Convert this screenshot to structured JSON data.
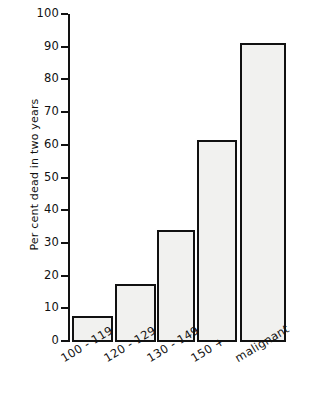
{
  "chart_data": {
    "type": "bar",
    "title": "",
    "subtitle": "",
    "xlabel": "",
    "ylabel": "Per cent dead in two years",
    "categories": [
      "100 - 119",
      "120 - 129",
      "130 - 149",
      "150 +",
      "malignant"
    ],
    "values": [
      7.5,
      17.5,
      34,
      61.5,
      91
    ],
    "ylim": [
      0,
      100
    ],
    "ytick_labels": [
      "0",
      "10",
      "20",
      "30",
      "40",
      "50",
      "60",
      "70",
      "80",
      "90",
      "100"
    ],
    "ytick_values": [
      0,
      10,
      20,
      30,
      40,
      50,
      60,
      70,
      80,
      90,
      100
    ],
    "grid": false,
    "legend": null,
    "legend_position": "none",
    "annotations": [],
    "colors": {
      "bar_fill": "#f1f1ef",
      "bar_edge": "#111111",
      "axis": "#121212",
      "text": "#111111",
      "background": "#ffffff"
    },
    "xlabel_rotation_deg": -31
  },
  "bar_geometry": [
    {
      "left": 72,
      "width": 41
    },
    {
      "left": 115,
      "width": 41
    },
    {
      "left": 157,
      "width": 38
    },
    {
      "left": 197,
      "width": 40
    },
    {
      "left": 240,
      "width": 46
    }
  ],
  "label_anchors": [
    {
      "x": 62,
      "y": 352
    },
    {
      "x": 105,
      "y": 352
    },
    {
      "x": 148,
      "y": 352
    },
    {
      "x": 192,
      "y": 352
    },
    {
      "x": 236,
      "y": 352
    }
  ]
}
